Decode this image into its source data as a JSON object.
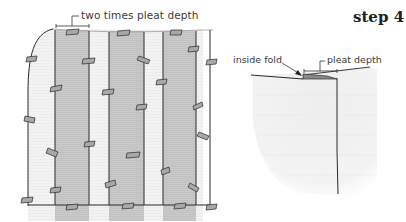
{
  "title": "step 4",
  "left_panel": {
    "annotation": "two times pleat depth",
    "pleat_count": 3,
    "colors": {
      "fabric": "#f3f3f3",
      "pleat": "#c8c8c8",
      "line": "#2a2a2a",
      "pin": "#9a9a9a"
    }
  },
  "right_panel": {
    "annotations": {
      "inside_fold": "inside fold",
      "pleat_depth": "pleat depth"
    },
    "colors": {
      "fabric": "#f1f1f1",
      "fold": "#8a8a8a",
      "line": "#2a2a2a"
    }
  }
}
